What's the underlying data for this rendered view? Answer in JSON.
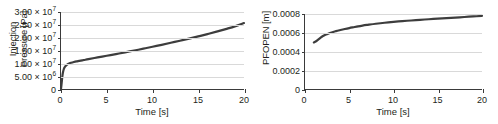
{
  "figure": {
    "background": "#ffffff",
    "curve_color": "#3d3d3d",
    "grid_color": "#d9d9d9",
    "axis_color": "#3a3a3a"
  },
  "chart_data": [
    {
      "type": "line",
      "id": "injection-pressure",
      "title": "",
      "xlabel": "Time [s]",
      "ylabel": "Injection Pressure [Pa]",
      "ylabel_lines": [
        "Injection",
        "Pressure [Pa]"
      ],
      "xlim": [
        0,
        20
      ],
      "ylim": [
        0,
        30000000
      ],
      "grid": true,
      "legend": "none",
      "xticks": [
        0,
        5,
        10,
        15,
        20
      ],
      "xticklabels": [
        "0",
        "5",
        "10",
        "15",
        "20"
      ],
      "yticks": [
        0,
        5000000,
        10000000,
        15000000,
        20000000,
        25000000,
        30000000
      ],
      "yticklabels": [
        {
          "mantissa": "0",
          "times": "",
          "base": "",
          "exp": ""
        },
        {
          "mantissa": "5.00",
          "times": "×",
          "base": "10",
          "exp": "6"
        },
        {
          "mantissa": "1.00",
          "times": "×",
          "base": "10",
          "exp": "7"
        },
        {
          "mantissa": "1.50",
          "times": "×",
          "base": "10",
          "exp": "7"
        },
        {
          "mantissa": "2.00",
          "times": "×",
          "base": "10",
          "exp": "7"
        },
        {
          "mantissa": "2.50",
          "times": "×",
          "base": "10",
          "exp": "7"
        },
        {
          "mantissa": "3.00",
          "times": "×",
          "base": "10",
          "exp": "7"
        }
      ],
      "x": [
        0.0,
        0.05,
        0.1,
        0.15,
        0.2,
        0.3,
        0.4,
        0.5,
        0.7,
        0.9,
        1.1,
        1.4,
        1.7,
        2.0,
        2.5,
        3.0,
        4.0,
        5.0,
        6.0,
        7.0,
        8.0,
        9.0,
        10.0,
        11.0,
        12.0,
        13.0,
        14.0,
        15.0,
        16.0,
        17.0,
        18.0,
        19.0,
        20.0
      ],
      "y": [
        0,
        1600000,
        3400000,
        5000000,
        6200000,
        7700000,
        8500000,
        9000000,
        9600000,
        9950000,
        10200000,
        10500000,
        10750000,
        10950000,
        11300000,
        11650000,
        12300000,
        12950000,
        13600000,
        14300000,
        15000000,
        15700000,
        16450000,
        17200000,
        18000000,
        18800000,
        19650000,
        20500000,
        21400000,
        22350000,
        23350000,
        24400000,
        25700000
      ]
    },
    {
      "type": "line",
      "id": "pfopen",
      "title": "",
      "xlabel": "Time [s]",
      "ylabel": "PFOPEN [m]",
      "ylabel_lines": [
        "PFOPEN [m]"
      ],
      "xlim": [
        0,
        20
      ],
      "ylim": [
        0,
        0.0008
      ],
      "grid": true,
      "legend": "none",
      "xticks": [
        0,
        5,
        10,
        15,
        20
      ],
      "xticklabels": [
        "0",
        "5",
        "10",
        "15",
        "20"
      ],
      "yticks": [
        0,
        0.0002,
        0.0004,
        0.0006,
        0.0008
      ],
      "yticklabels": [
        "0",
        "0.0002",
        "0.0004",
        "0.0006",
        "0.0008"
      ],
      "x": [
        1.0,
        1.3,
        1.6,
        1.9,
        2.2,
        2.5,
        3.0,
        3.5,
        4.0,
        4.5,
        5.0,
        5.5,
        6.0,
        6.5,
        7.0,
        8.0,
        9.0,
        10.0,
        11.0,
        12.0,
        13.0,
        14.0,
        15.0,
        16.0,
        17.0,
        18.0,
        19.0,
        20.0
      ],
      "y": [
        0.000497,
        0.000512,
        0.000535,
        0.000557,
        0.000573,
        0.000585,
        0.000603,
        0.000617,
        0.000629,
        0.00064,
        0.00065,
        0.000659,
        0.000668,
        0.000676,
        0.000683,
        0.000696,
        0.000707,
        0.000716,
        0.000724,
        0.000731,
        0.000738,
        0.000744,
        0.00075,
        0.000756,
        0.000762,
        0.000768,
        0.000774,
        0.00078
      ]
    }
  ]
}
